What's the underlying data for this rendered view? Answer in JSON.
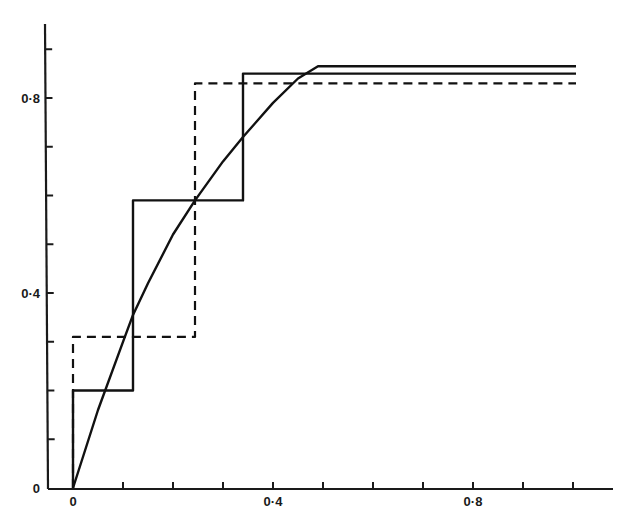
{
  "chart_data": {
    "type": "line",
    "title": "",
    "xlabel": "",
    "ylabel": "",
    "xlim": [
      0,
      1.0
    ],
    "ylim": [
      0,
      0.95
    ],
    "grid": false,
    "legend": null,
    "x_tick_labels": [
      "0",
      "0·4",
      "0·8"
    ],
    "x_tick_values": [
      0,
      0.4,
      0.8
    ],
    "x_minor_ticks": [
      0.1,
      0.2,
      0.3,
      0.5,
      0.6,
      0.7,
      0.9,
      1.0
    ],
    "y_tick_labels": [
      "0",
      "0·4",
      "0·8"
    ],
    "y_tick_values": [
      0,
      0.4,
      0.8
    ],
    "y_minor_ticks": [
      0.1,
      0.2,
      0.3,
      0.5,
      0.6,
      0.7,
      0.9
    ],
    "series": [
      {
        "name": "smooth-curve",
        "style": "solid",
        "x": [
          0,
          0.05,
          0.1,
          0.12,
          0.15,
          0.2,
          0.244,
          0.3,
          0.34,
          0.4,
          0.45,
          0.49,
          0.6,
          0.8,
          1.0
        ],
        "y": [
          0,
          0.16,
          0.3,
          0.355,
          0.42,
          0.52,
          0.59,
          0.67,
          0.72,
          0.79,
          0.84,
          0.865,
          0.865,
          0.865,
          0.865
        ]
      },
      {
        "name": "solid-step",
        "style": "solid-step",
        "x": [
          0,
          0,
          0.12,
          0.12,
          0.34,
          0.34,
          1.0
        ],
        "y": [
          0,
          0.2,
          0.2,
          0.59,
          0.59,
          0.85,
          0.85
        ]
      },
      {
        "name": "dashed-step",
        "style": "dashed-step",
        "x": [
          0,
          0,
          0.244,
          0.244,
          1.0
        ],
        "y": [
          0,
          0.31,
          0.31,
          0.83,
          0.83
        ]
      }
    ]
  },
  "axes": {
    "x_labels": [
      "0",
      "0·4",
      "0·8"
    ],
    "y_labels": [
      "0",
      "0·4",
      "0·8"
    ]
  }
}
